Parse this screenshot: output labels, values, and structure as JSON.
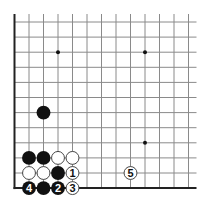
{
  "diagram": {
    "type": "go-board-fragment",
    "board_view": {
      "columns": 13,
      "rows": 12,
      "left_edge": true,
      "bottom_edge": true,
      "origin_x": 14.5,
      "origin_y": 22,
      "spacing_x": 14.5,
      "spacing_y": 15.1,
      "line_extend_right": 8,
      "line_extend_top": 8,
      "line_color": "#8a8a8a",
      "edge_color": "#222222"
    },
    "star_points": [
      {
        "col": 3,
        "row": 2
      },
      {
        "col": 9,
        "row": 2
      },
      {
        "col": 9,
        "row": 8
      }
    ],
    "stones": [
      {
        "color": "black",
        "col": 2,
        "row": 6,
        "label": ""
      },
      {
        "color": "black",
        "col": 1,
        "row": 9,
        "label": ""
      },
      {
        "color": "black",
        "col": 2,
        "row": 9,
        "label": ""
      },
      {
        "color": "white",
        "col": 3,
        "row": 9,
        "label": ""
      },
      {
        "color": "white",
        "col": 4,
        "row": 9,
        "label": ""
      },
      {
        "color": "white",
        "col": 1,
        "row": 10,
        "label": ""
      },
      {
        "color": "white",
        "col": 2,
        "row": 10,
        "label": ""
      },
      {
        "color": "black",
        "col": 3,
        "row": 10,
        "label": ""
      },
      {
        "color": "white",
        "col": 4,
        "row": 10,
        "label": "1"
      },
      {
        "color": "black",
        "col": 1,
        "row": 11,
        "label": "4"
      },
      {
        "color": "black",
        "col": 2,
        "row": 11,
        "label": ""
      },
      {
        "color": "black",
        "col": 3,
        "row": 11,
        "label": "2"
      },
      {
        "color": "white",
        "col": 4,
        "row": 11,
        "label": "3"
      },
      {
        "color": "white",
        "col": 8,
        "row": 10,
        "label": "5"
      }
    ],
    "colors": {
      "black_stone": "#111111",
      "white_stone": "#ffffff",
      "white_stone_stroke": "#333333",
      "label_on_black": "#ffffff",
      "label_on_white": "#111111"
    }
  }
}
